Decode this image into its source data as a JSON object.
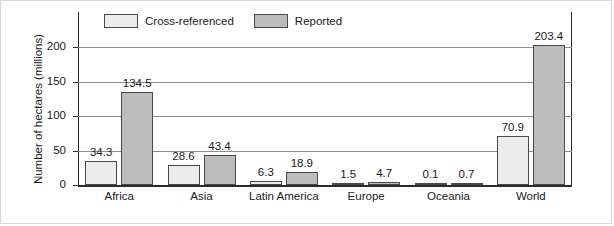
{
  "chart_data": {
    "type": "bar",
    "title": "",
    "xlabel": "",
    "ylabel": "Number of hectares (millions)",
    "categories": [
      "Africa",
      "Asia",
      "Latin America",
      "Europe",
      "Oceania",
      "World"
    ],
    "series": [
      {
        "name": "Cross-referenced",
        "color": "#ececec",
        "values": [
          34.3,
          28.6,
          6.3,
          1.5,
          0.1,
          70.9
        ],
        "labels": [
          "34.3",
          "28.6",
          "6.3",
          "1.5",
          "0.1",
          "70.9"
        ]
      },
      {
        "name": "Reported",
        "color": "#bcbcbc",
        "values": [
          134.5,
          43.4,
          18.9,
          4.7,
          0.7,
          203.4
        ],
        "labels": [
          "134.5",
          "43.4",
          "18.9",
          "4.7",
          "0.7",
          "203.4"
        ]
      }
    ],
    "ylim": [
      0,
      225
    ],
    "yticks": [
      0,
      50,
      100,
      150,
      200
    ],
    "ytick_labels": [
      "0",
      "50",
      "100",
      "150",
      "200"
    ],
    "grid": true,
    "legend_position": "top-left",
    "bar_border_color": "#4a4a4a",
    "axis_color": "#2b2b2b",
    "gridline_color": "#8f8f8f"
  }
}
